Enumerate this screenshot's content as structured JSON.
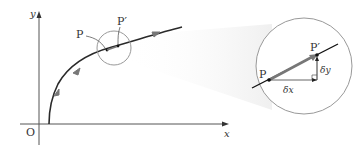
{
  "diagram": {
    "axes": {
      "x_label": "x",
      "y_label": "y",
      "origin_label": "O"
    },
    "curve": {
      "point_P_label": "P",
      "point_P_prime_label": "P′"
    },
    "magnified": {
      "point_P_label": "P",
      "point_P_prime_label": "P′",
      "dx_label": "δx",
      "dy_label": "δy"
    },
    "colors": {
      "axis": "#555555",
      "curve": "#2a2a2a",
      "arrow": "#777777",
      "circle": "#999999",
      "halo": "#f2f2f2"
    }
  }
}
